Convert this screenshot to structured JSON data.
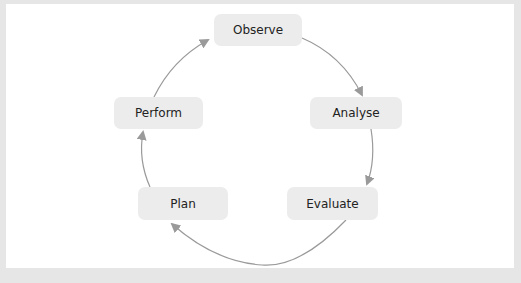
{
  "diagram": {
    "type": "cycle",
    "nodes": [
      {
        "id": "observe",
        "label": "Observe"
      },
      {
        "id": "analyse",
        "label": "Analyse"
      },
      {
        "id": "evaluate",
        "label": "Evaluate"
      },
      {
        "id": "plan",
        "label": "Plan"
      },
      {
        "id": "perform",
        "label": "Perform"
      }
    ],
    "edges": [
      {
        "from": "observe",
        "to": "analyse"
      },
      {
        "from": "analyse",
        "to": "evaluate"
      },
      {
        "from": "evaluate",
        "to": "plan"
      },
      {
        "from": "plan",
        "to": "perform"
      },
      {
        "from": "perform",
        "to": "observe"
      }
    ],
    "colors": {
      "node_fill": "#ececec",
      "arrow": "#999999",
      "background": "#ffffff",
      "frame": "#e6e6e6"
    }
  }
}
